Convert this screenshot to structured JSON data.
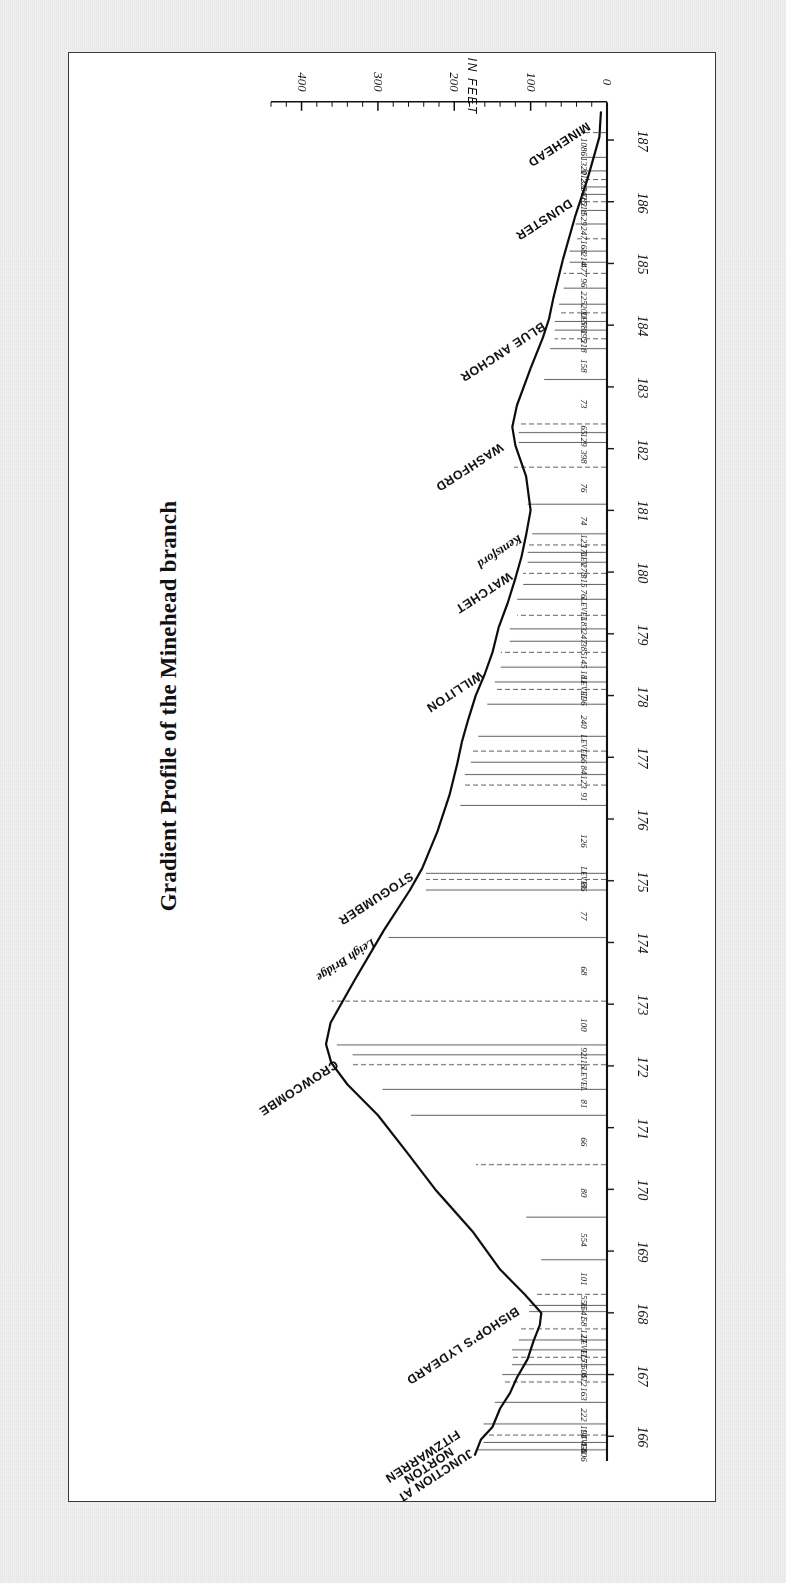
{
  "figure": {
    "title": "Gradient Profile of the Minehead branch",
    "frame_color": "#3a3a3a",
    "paper_color": "#ffffff",
    "ink_color": "#101010"
  },
  "axis": {
    "label": "ALTITUDE IN FEET",
    "ticks": [
      "0",
      "100",
      "200",
      "300",
      "400"
    ],
    "range": [
      0,
      440
    ],
    "minor_tick_step": 20
  },
  "mileposts": [
    "166",
    "167",
    "168",
    "169",
    "170",
    "171",
    "172",
    "173",
    "174",
    "175",
    "176",
    "177",
    "178",
    "179",
    "180",
    "181",
    "182",
    "183",
    "184",
    "185",
    "186",
    "187"
  ],
  "stations": [
    {
      "name": "JUNCTION AT\nNORTON\nFITZWARREN",
      "style": "block-multi"
    },
    {
      "name": "BISHOP'S LYDEARD",
      "style": "block"
    },
    {
      "name": "CROWCOMBE",
      "style": "block"
    },
    {
      "name": "STOGUMBER",
      "style": "block"
    },
    {
      "name": "Leigh Bridge",
      "style": "script"
    },
    {
      "name": "WILLITON",
      "style": "block"
    },
    {
      "name": "WATCHET",
      "style": "block"
    },
    {
      "name": "Kentsford",
      "style": "script"
    },
    {
      "name": "WASHFORD",
      "style": "block"
    },
    {
      "name": "BLUE ANCHOR",
      "style": "block"
    },
    {
      "name": "DUNSTER",
      "style": "block"
    },
    {
      "name": "MINEHEAD",
      "style": "block"
    }
  ],
  "gradient_marks": [
    "406",
    "431",
    "LEVEL",
    "194",
    "222",
    "163",
    "412",
    "505",
    "75",
    "115",
    "LEVEL",
    "127",
    "58",
    "1541",
    "556",
    "101",
    "554",
    "80",
    "66",
    "81",
    "LEVEL",
    "116",
    "92",
    "100",
    "68",
    "77",
    "86",
    "LEVEL",
    "126",
    "91",
    "123",
    "84",
    "66",
    "LEVEL",
    "240",
    "196",
    "LEVEL",
    "181",
    "145",
    "385",
    "247",
    "183",
    "LEVEL",
    "76",
    "315",
    "278",
    "LEV",
    "171",
    "123",
    "74",
    "76",
    "398",
    "129",
    "65",
    "73",
    "158",
    "218",
    "195",
    "581",
    "LEV",
    "200",
    "225",
    "96",
    "477",
    "214",
    "168",
    "247",
    "529",
    "518",
    "182",
    "143",
    "223",
    "113",
    "1320",
    "1086",
    "LEVEL"
  ],
  "chart_data": {
    "type": "line",
    "title": "Gradient Profile of the Minehead branch",
    "xlabel": "",
    "ylabel": "ALTITUDE IN FEET",
    "xlim": [
      165.6,
      187.6
    ],
    "ylim": [
      0,
      440
    ],
    "grid": false,
    "legend": "none",
    "x_tick_labels": [
      "166",
      "167",
      "168",
      "169",
      "170",
      "171",
      "172",
      "173",
      "174",
      "175",
      "176",
      "177",
      "178",
      "179",
      "180",
      "181",
      "182",
      "183",
      "184",
      "185",
      "186",
      "187"
    ],
    "y_tick_labels": [
      "0",
      "100",
      "200",
      "300",
      "400"
    ],
    "x": [
      165.7,
      165.95,
      166.15,
      166.45,
      166.7,
      166.95,
      167.25,
      167.55,
      167.8,
      168.0,
      168.3,
      168.7,
      169.3,
      170.0,
      170.6,
      171.2,
      171.7,
      172.05,
      172.35,
      172.7,
      173.4,
      174.2,
      174.85,
      175.2,
      175.8,
      176.4,
      176.9,
      177.25,
      177.6,
      178.0,
      178.35,
      178.7,
      179.1,
      179.5,
      179.9,
      180.25,
      180.6,
      181.0,
      181.55,
      182.05,
      182.35,
      182.7,
      183.3,
      183.8,
      184.1,
      184.45,
      184.75,
      185.05,
      185.4,
      185.75,
      186.05,
      186.35,
      186.7,
      187.05,
      187.45
    ],
    "y": [
      173,
      165,
      150,
      140,
      127,
      118,
      104,
      96,
      88,
      86,
      108,
      140,
      175,
      225,
      262,
      300,
      340,
      361,
      368,
      362,
      330,
      292,
      258,
      242,
      222,
      206,
      196,
      190,
      182,
      172,
      160,
      150,
      142,
      130,
      120,
      112,
      106,
      100,
      106,
      120,
      124,
      118,
      100,
      84,
      76,
      70,
      64,
      58,
      50,
      42,
      34,
      26,
      18,
      10,
      8
    ],
    "annotations": {
      "stations": [
        {
          "label": "JUNCTION AT NORTON FITZWARREN",
          "mile": 165.75
        },
        {
          "label": "BISHOP'S LYDEARD",
          "mile": 168.05
        },
        {
          "label": "CROWCOMBE",
          "mile": 172.05
        },
        {
          "label": "STOGUMBER",
          "mile": 175.1
        },
        {
          "label": "Leigh Bridge",
          "mile": 174.0
        },
        {
          "label": "WILLITON",
          "mile": 178.35
        },
        {
          "label": "WATCHET",
          "mile": 179.95
        },
        {
          "label": "Kentsford",
          "mile": 180.55
        },
        {
          "label": "WASHFORD",
          "mile": 182.05
        },
        {
          "label": "BLUE ANCHOR",
          "mile": 184.0
        },
        {
          "label": "DUNSTER",
          "mile": 186.0
        },
        {
          "label": "MINEHEAD",
          "mile": 187.25
        }
      ]
    }
  }
}
